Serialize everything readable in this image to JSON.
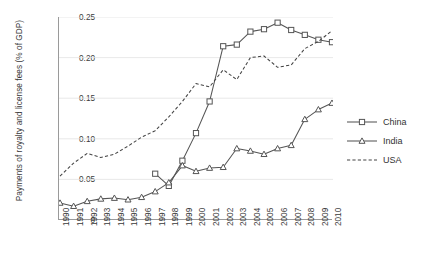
{
  "chart_data": {
    "type": "line",
    "title": "",
    "xlabel": "",
    "ylabel": "Payments of royalty and license fees (% of GDP)",
    "grid": true,
    "legend_position": "right",
    "xlim": [
      1990,
      2010
    ],
    "ylim": [
      0,
      0.25
    ],
    "ytick_labels": [
      "0.25",
      "0.20",
      "0.15",
      "0.10",
      "0.05",
      "0"
    ],
    "ytick_values": [
      0.25,
      0.2,
      0.15,
      0.1,
      0.05,
      0
    ],
    "categories": [
      1990,
      1991,
      1992,
      1993,
      1994,
      1995,
      1996,
      1997,
      1998,
      1999,
      2000,
      2001,
      2002,
      2003,
      2004,
      2005,
      2006,
      2007,
      2008,
      2009,
      2010
    ],
    "xtick_labels": [
      "1990",
      "1991",
      "1992",
      "1993",
      "1994",
      "1995",
      "1996",
      "1997",
      "1998",
      "1999",
      "2000",
      "2001",
      "2002",
      "2003",
      "2004",
      "2005",
      "2006",
      "2007",
      "2008",
      "2009",
      "2010"
    ],
    "series": [
      {
        "name": "China",
        "marker": "square",
        "line_style": "solid",
        "color": "#555555",
        "x": [
          1997,
          1998,
          1999,
          2000,
          2001,
          2002,
          2003,
          2004,
          2005,
          2006,
          2007,
          2008,
          2009,
          2010
        ],
        "values": [
          0.057,
          0.042,
          0.073,
          0.107,
          0.146,
          0.214,
          0.216,
          0.232,
          0.235,
          0.243,
          0.234,
          0.228,
          0.222,
          0.219
        ]
      },
      {
        "name": "India",
        "marker": "triangle",
        "line_style": "solid",
        "color": "#555555",
        "x": [
          1990,
          1991,
          1992,
          1993,
          1994,
          1995,
          1996,
          1997,
          1998,
          1999,
          2000,
          2001,
          2002,
          2003,
          2004,
          2005,
          2006,
          2007,
          2008,
          2009,
          2010
        ],
        "values": [
          0.021,
          0.017,
          0.023,
          0.026,
          0.027,
          0.025,
          0.028,
          0.035,
          0.046,
          0.067,
          0.06,
          0.064,
          0.065,
          0.088,
          0.085,
          0.081,
          0.088,
          0.092,
          0.124,
          0.136,
          0.144
        ]
      },
      {
        "name": "USA",
        "marker": "none",
        "line_style": "dashed",
        "color": "#444444",
        "x": [
          1990,
          1991,
          1992,
          1993,
          1994,
          1995,
          1996,
          1997,
          1998,
          1999,
          2000,
          2001,
          2002,
          2003,
          2004,
          2005,
          2006,
          2007,
          2008,
          2009,
          2010
        ],
        "values": [
          0.054,
          0.07,
          0.082,
          0.077,
          0.081,
          0.091,
          0.102,
          0.11,
          0.127,
          0.146,
          0.168,
          0.164,
          0.185,
          0.173,
          0.2,
          0.202,
          0.188,
          0.191,
          0.211,
          0.22,
          0.233
        ]
      }
    ]
  },
  "legend": {
    "items": [
      {
        "label": "China",
        "symbol": "square-marker-solid-line"
      },
      {
        "label": "India",
        "symbol": "triangle-marker-solid-line"
      },
      {
        "label": "USA",
        "symbol": "dashed-line"
      }
    ]
  }
}
